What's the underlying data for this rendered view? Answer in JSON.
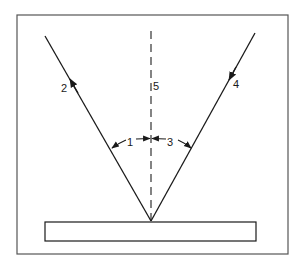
{
  "diagram": {
    "type": "reflection-angle-diagram",
    "labels": {
      "angle_left": "1",
      "reflected_ray": "2",
      "angle_right": "3",
      "incident_ray": "4",
      "normal_line": "5"
    },
    "elements": {
      "frame": "outer border frame",
      "surface": "reflecting surface (rectangle)",
      "normal": "dashed vertical normal line",
      "incident_ray": "ray traveling down-left toward surface",
      "reflected_ray": "ray traveling up-left away from surface"
    },
    "colors": {
      "line": "#1a1a1a",
      "frame": "#555555",
      "background": "#ffffff"
    }
  }
}
